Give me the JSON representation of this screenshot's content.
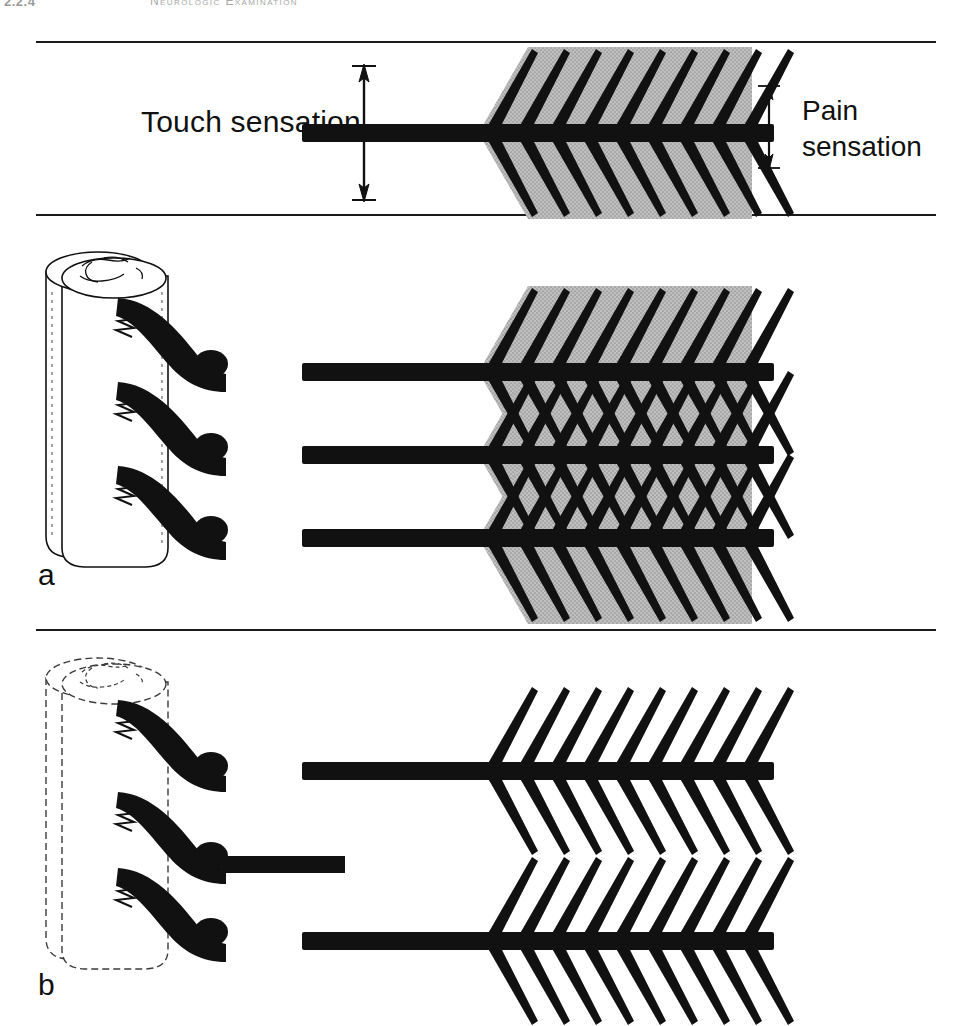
{
  "page": {
    "running_head": {
      "folio": "2.2.4",
      "title": "Neurologic Examination"
    },
    "background_color": "#ffffff",
    "ink_color": "#111111",
    "shade_color": "#b9b9b9"
  },
  "labels": {
    "touch_sensation": "Touch sensation",
    "pain_sensation_line1": "Pain",
    "pain_sensation_line2": "sensation",
    "panel_a": "a",
    "panel_b": "b"
  },
  "legend_panel": {
    "name": "sensation-legend",
    "touch_arrow": {
      "name": "touch-extent-arrow",
      "orientation": "vertical",
      "double_headed": true,
      "top_y": 68,
      "bottom_y": 198,
      "x": 364
    },
    "pain_arrow": {
      "name": "pain-extent-arrow",
      "orientation": "vertical",
      "double_headed": true,
      "top_y": 86,
      "bottom_y": 168,
      "x": 769
    },
    "fiber": {
      "name": "legend-nerve-fiber",
      "shaded": true,
      "spine_pairs": 9,
      "axon_y": 133
    }
  },
  "panels": [
    {
      "id": "a",
      "name": "panel-a-intact-innervation",
      "letter": "a",
      "spinal_cord": {
        "name": "spinal-cord-segment",
        "style": "solid-outline",
        "root_count": 3,
        "ganglion_count": 3
      },
      "fibers": {
        "count": 3,
        "shaded": true,
        "overlapping_fields": true,
        "spine_pairs_per_fiber": 9,
        "axon_y_positions": [
          372,
          455,
          538
        ]
      },
      "description": "Three intact peripheral nerves with overlapping, interdigitating receptive fields"
    },
    {
      "id": "b",
      "name": "panel-b-denervated",
      "letter": "b",
      "spinal_cord": {
        "name": "spinal-cord-segment",
        "style": "dashed-outline",
        "root_count": 3,
        "ganglion_count": 3
      },
      "fibers": {
        "count": 3,
        "shaded": false,
        "overlapping_fields": false,
        "spine_pairs_per_fiber": 9,
        "axon_y_positions": [
          771,
          864,
          941
        ],
        "severed_fiber_index": 1,
        "severed_fiber_end_x": 345
      },
      "description": "Middle nerve severed; remaining two nerves show non-overlapping receptive fields"
    }
  ]
}
